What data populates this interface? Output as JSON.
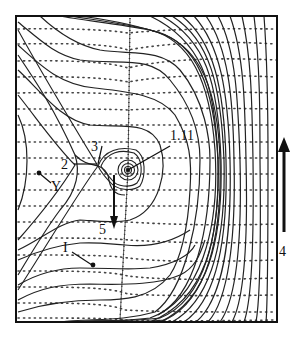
{
  "figure": {
    "type": "phase-portrait",
    "frame": {
      "x": 16,
      "y": 16,
      "w": 261,
      "h": 306
    },
    "colors": {
      "line": "#222222",
      "dots": "#333333",
      "background": "#ffffff"
    }
  },
  "labels": {
    "l111": "1.11",
    "l2": "2",
    "l3": "3",
    "l4": "4",
    "l5": "5",
    "lY": "Y",
    "lI": "I"
  },
  "arrows": [
    {
      "name": "arrow-4",
      "direction": "up"
    },
    {
      "name": "arrow-5",
      "direction": "down"
    }
  ]
}
